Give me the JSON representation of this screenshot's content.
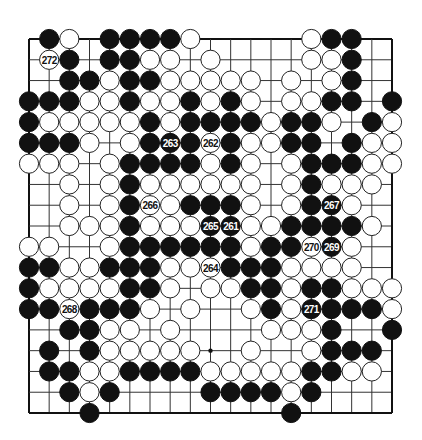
{
  "diagram": {
    "type": "go-board",
    "size": 19,
    "colors": {
      "black": "#111111",
      "white": "#ffffff",
      "line": "#333333",
      "background": "#ffffff"
    },
    "legend": "B = black stone, W = white stone, . = empty, + = star point",
    "rows": [
      ".BW.BBBBW.....WBB..",
      ".WB.BBWW.W....WWB..",
      "..BBWBBWWWWW.W.WB..",
      "BBBWWBWWBWBW.WWBB.B",
      "BWWWWWBWBBBBWBBW.BW",
      "BBBW.WBBBWBWWBB.BWW",
      "WWW.WBBBBWBW.WBBBWW",
      "..W.WBWWWWWW.WBWWW.",
      "..W.WBWWBBBW.WBBW..",
      "..WWWBWWWBBWWBBBBW.",
      "WW..WBBBBBBWBBWBW..",
      "BBWWBBBWWWBBBWWWW..",
      "BWWWWBBW.WWBBWBBWWW",
      "BBWBBBW.W..WBWBBBBW",
      "..BBWW.W....WWWB..B",
      ".B.BWWWWW+.W..WBBB.",
      ".BBWWBBBBWWWWWBBWW.",
      "..BWB....BBBBWB....",
      "...B.........B....."
    ],
    "numbered_stones": [
      {
        "label": "261",
        "color": "black",
        "col": 10,
        "row": 9
      },
      {
        "label": "262",
        "color": "white",
        "col": 9,
        "row": 5
      },
      {
        "label": "263",
        "color": "black",
        "col": 7,
        "row": 5
      },
      {
        "label": "264",
        "color": "white",
        "col": 9,
        "row": 11
      },
      {
        "label": "265",
        "color": "black",
        "col": 9,
        "row": 9
      },
      {
        "label": "266",
        "color": "white",
        "col": 6,
        "row": 8
      },
      {
        "label": "267",
        "color": "black",
        "col": 15,
        "row": 8
      },
      {
        "label": "268",
        "color": "white",
        "col": 2,
        "row": 13
      },
      {
        "label": "269",
        "color": "black",
        "col": 15,
        "row": 10
      },
      {
        "label": "270",
        "color": "white",
        "col": 14,
        "row": 10
      },
      {
        "label": "271",
        "color": "black",
        "col": 14,
        "row": 13
      },
      {
        "label": "272",
        "color": "white",
        "col": 1,
        "row": 1
      }
    ],
    "star_points": [
      {
        "col": 9,
        "row": 15
      }
    ]
  }
}
